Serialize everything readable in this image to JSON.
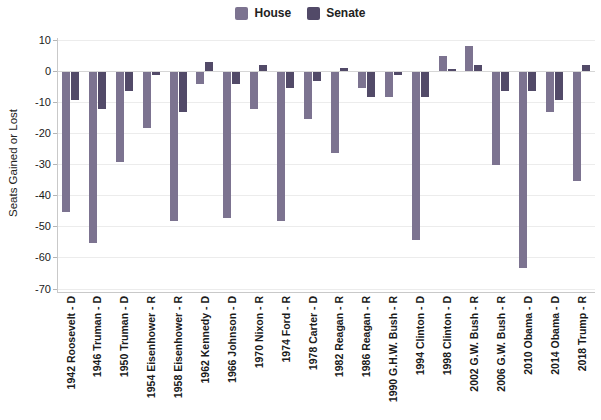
{
  "chart_data": {
    "type": "bar",
    "title": "",
    "ylabel": "Seats Gained or Lost",
    "xlabel": "",
    "ylim": [
      -70,
      10
    ],
    "yticks": [
      10,
      0,
      -10,
      -20,
      -30,
      -40,
      -50,
      -60,
      -70
    ],
    "grid": true,
    "legend_position": "top",
    "categories": [
      "1942 Roosevelt - D",
      "1946 Truman - D",
      "1950 Truman - D",
      "1954 Eisenhower - R",
      "1958 Eisenhower - R",
      "1962 Kennedy - D",
      "1966 Johnson - D",
      "1970 Nixon - R",
      "1974 Ford - R",
      "1978 Carter - D",
      "1982 Reagan - R",
      "1986 Reagan - R",
      "1990 G.H.W. Bush - R",
      "1994 Clinton - D",
      "1998 Clinton - D",
      "2002 G.W. Bush - R",
      "2006 G.W. Bush - R",
      "2010 Obama - D",
      "2014 Obama - D",
      "2018 Trump - R"
    ],
    "series": [
      {
        "name": "House",
        "color": "#7c7390",
        "values": [
          -45,
          -55,
          -29,
          -18,
          -48,
          -4,
          -47,
          -12,
          -48,
          -15,
          -26,
          -5,
          -8,
          -54,
          5,
          8,
          -30,
          -63,
          -13,
          -35
        ]
      },
      {
        "name": "Senate",
        "color": "#524a68",
        "values": [
          -9,
          -12,
          -6,
          -1,
          -13,
          3,
          -4,
          2,
          -5,
          -3,
          1,
          -8,
          -1,
          -8,
          0,
          2,
          -6,
          -6,
          -9,
          2
        ]
      }
    ]
  },
  "colors": {
    "background": "#ffffff",
    "grid": "#ececec",
    "axis": "#c9c9c9",
    "text": "#1a1a1a"
  }
}
